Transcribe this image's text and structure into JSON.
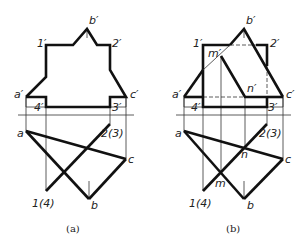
{
  "figures": [
    {
      "id": "a",
      "caption": "(a)",
      "front_view_labels": {
        "a": "a′",
        "b": "b′",
        "c": "c′",
        "p1": "1′",
        "p2": "2′",
        "p3": "3′",
        "p4": "4′"
      },
      "top_view_labels": {
        "a": "a",
        "b": "b",
        "c": "c",
        "p14": "1(4)",
        "p23": "2(3)"
      }
    },
    {
      "id": "b",
      "caption": "(b)",
      "front_view_labels": {
        "a": "a′",
        "b": "b′",
        "c": "c′",
        "p1": "1′",
        "p2": "2′",
        "p3": "3′",
        "p4": "4′",
        "m": "m′",
        "n": "n′"
      },
      "top_view_labels": {
        "a": "a",
        "b": "b",
        "c": "c",
        "p14": "1(4)",
        "p23": "2(3)",
        "m": "m",
        "n": "n"
      }
    }
  ],
  "colors": {
    "line": "#111111",
    "background": "#ffffff"
  }
}
